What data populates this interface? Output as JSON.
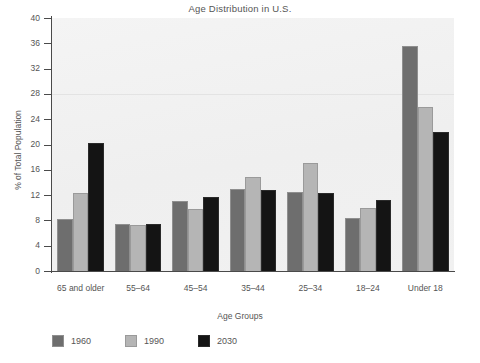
{
  "chart_data": {
    "type": "bar",
    "title": "Age Distribution in U.S.",
    "xlabel": "Age Groups",
    "ylabel": "% of Total Population",
    "categories": [
      "65 and older",
      "55–64",
      "45–54",
      "35–44",
      "25–34",
      "18–24",
      "Under 18"
    ],
    "series": [
      {
        "name": "1960",
        "color": "#6e6e6e",
        "values": [
          8.3,
          7.4,
          11.0,
          13.0,
          12.5,
          8.4,
          35.6
        ]
      },
      {
        "name": "1990",
        "color": "#b5b5b5",
        "values": [
          12.3,
          7.3,
          9.8,
          14.8,
          17.0,
          10.0,
          26.0
        ]
      },
      {
        "name": "2030",
        "color": "#141414",
        "values": [
          20.2,
          7.4,
          11.7,
          12.8,
          12.3,
          11.3,
          22.0
        ]
      }
    ],
    "ylim": [
      0,
      40
    ],
    "yticks": [
      0,
      4,
      8,
      12,
      16,
      20,
      24,
      28,
      32,
      36,
      40
    ],
    "ytick_labels": [
      "0",
      "4",
      "8",
      "12",
      "16",
      "20",
      "24",
      "28",
      "32",
      "36",
      "40"
    ],
    "grid": false,
    "legend_position": "bottom-left",
    "plot_background": "#f2f2f2",
    "axis_color": "#4a4a4a",
    "text_color": "#555555"
  }
}
